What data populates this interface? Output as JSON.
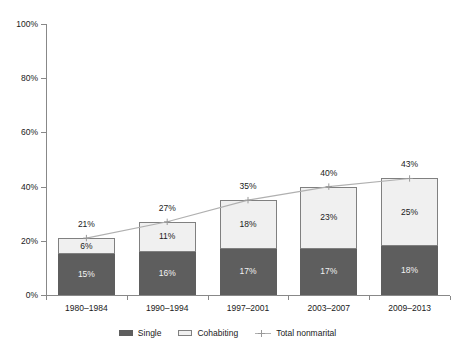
{
  "chart_data": {
    "type": "bar",
    "subtype": "stacked-bar-with-line-overlay",
    "title": "",
    "xlabel": "",
    "ylabel": "",
    "ylim": [
      0,
      100
    ],
    "y_ticks": [
      "0%",
      "20%",
      "40%",
      "60%",
      "80%",
      "100%"
    ],
    "y_tick_values": [
      0,
      20,
      40,
      60,
      80,
      100
    ],
    "grid": false,
    "legend_position": "bottom-center",
    "categories": [
      "1980–1984",
      "1990–1994",
      "1997–2001",
      "2003–2007",
      "2009–2013"
    ],
    "series": [
      {
        "name": "Single",
        "type": "bar",
        "color": "#5e5e5e",
        "values": [
          15,
          16,
          17,
          17,
          18
        ],
        "labels": [
          "15%",
          "16%",
          "17%",
          "17%",
          "18%"
        ]
      },
      {
        "name": "Cohabiting",
        "type": "bar",
        "color": "#f0f0f0",
        "border_color": "#808080",
        "values": [
          6,
          11,
          18,
          23,
          25
        ],
        "labels": [
          "6%",
          "11%",
          "18%",
          "23%",
          "25%"
        ]
      },
      {
        "name": "Total nonmarital",
        "type": "line",
        "color": "#b0b0b0",
        "marker": "plus",
        "values": [
          21,
          27,
          35,
          40,
          43
        ],
        "labels": [
          "21%",
          "27%",
          "35%",
          "40%",
          "43%"
        ]
      }
    ]
  },
  "legend": {
    "items": [
      {
        "label": "Single",
        "swatch": "single-swatch-icon"
      },
      {
        "label": "Cohabiting",
        "swatch": "cohabiting-swatch-icon"
      },
      {
        "label": "Total nonmarital",
        "swatch": "line-marker-icon"
      }
    ]
  },
  "colors": {
    "single": "#5e5e5e",
    "cohabiting": "#f0f0f0",
    "cohabiting_border": "#808080",
    "line": "#b0b0b0",
    "axis": "#888888",
    "text": "#1a1a1a",
    "background": "#ffffff"
  }
}
